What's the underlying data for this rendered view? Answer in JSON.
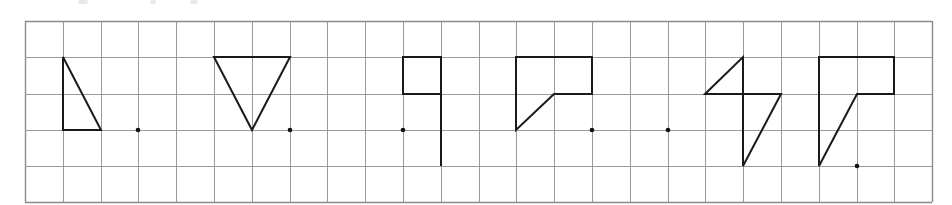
{
  "grid": {
    "left": 25,
    "top": 21,
    "cols": 24,
    "rows": 5,
    "col_lines": [
      25,
      63,
      101,
      138,
      176,
      214,
      252,
      290,
      327,
      365,
      403,
      441,
      479,
      516,
      554,
      592,
      630,
      668,
      705,
      743,
      781,
      819,
      857,
      894,
      932
    ],
    "row_lines": [
      21,
      57,
      94,
      130,
      166,
      202
    ],
    "line_color": "#9a9a9a",
    "border_color": "#8a8a8a"
  },
  "style": {
    "shape_stroke": "#1a1a1a",
    "shape_stroke_width": 2,
    "dot_color": "#111111",
    "dot_radius": 2.3
  },
  "figures": [
    {
      "name": "figure-1-right-triangle",
      "points": [
        [
          63,
          57
        ],
        [
          63,
          130
        ],
        [
          101,
          130
        ]
      ],
      "closed": true,
      "dot": [
        138,
        130
      ]
    },
    {
      "name": "figure-2-inverted-triangle",
      "points": [
        [
          214,
          57
        ],
        [
          290,
          57
        ],
        [
          252,
          130
        ]
      ],
      "closed": true,
      "dot": [
        290,
        130
      ]
    },
    {
      "name": "figure-3-flag",
      "points": [
        [
          441,
          166
        ],
        [
          441,
          57
        ],
        [
          403,
          57
        ],
        [
          403,
          94
        ],
        [
          441,
          94
        ]
      ],
      "closed": false,
      "dot": [
        403,
        130
      ]
    },
    {
      "name": "figure-4-l-shape",
      "points": [
        [
          516,
          57
        ],
        [
          592,
          57
        ],
        [
          592,
          94
        ],
        [
          554,
          94
        ],
        [
          516,
          130
        ]
      ],
      "closed": true,
      "dot": [
        592,
        130
      ]
    },
    {
      "name": "figure-5-lightning",
      "points": [
        [
          705,
          94
        ],
        [
          743,
          57
        ],
        [
          743,
          166
        ],
        [
          781,
          94
        ]
      ],
      "closed": true,
      "dot": [
        668,
        130
      ]
    },
    {
      "name": "figure-6-tall-l-shape",
      "points": [
        [
          819,
          57
        ],
        [
          894,
          57
        ],
        [
          894,
          94
        ],
        [
          857,
          94
        ],
        [
          819,
          166
        ]
      ],
      "closed": true,
      "dot": [
        857,
        166
      ]
    }
  ],
  "top_fragments": [
    [
      78,
      10
    ],
    [
      150,
      6
    ],
    [
      190,
      8
    ]
  ]
}
